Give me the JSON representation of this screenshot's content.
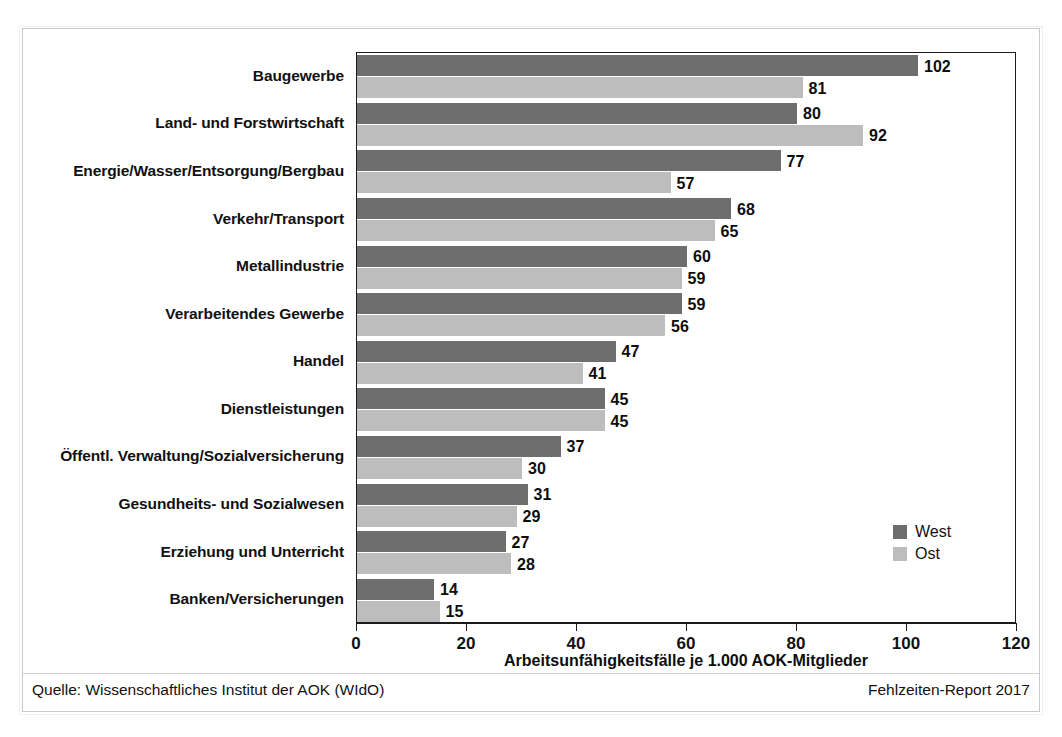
{
  "chart_data": {
    "type": "bar",
    "orientation": "horizontal",
    "title": "",
    "xlabel": "Arbeitsunfähigkeitsfälle je 1.000 AOK-Mitglieder",
    "ylabel": "",
    "xlim": [
      0,
      120
    ],
    "xticks": [
      0,
      20,
      40,
      60,
      80,
      100,
      120
    ],
    "xtick_labels": [
      "0",
      "20",
      "40",
      "60",
      "80",
      "100",
      "120"
    ],
    "grid": false,
    "legend_position": "inside-bottom-right",
    "categories": [
      "Baugewerbe",
      "Land- und Forstwirtschaft",
      "Energie/Wasser/Entsorgung/Bergbau",
      "Verkehr/Transport",
      "Metallindustrie",
      "Verarbeitendes Gewerbe",
      "Handel",
      "Dienstleistungen",
      "Öffentl. Verwaltung/Sozialversicherung",
      "Gesundheits- und Sozialwesen",
      "Erziehung und Unterricht",
      "Banken/Versicherungen"
    ],
    "series": [
      {
        "name": "West",
        "color": "#6e6e6e",
        "values": [
          102,
          80,
          77,
          68,
          60,
          59,
          47,
          45,
          37,
          31,
          27,
          14
        ]
      },
      {
        "name": "Ost",
        "color": "#bdbdbd",
        "values": [
          81,
          92,
          57,
          65,
          59,
          56,
          41,
          45,
          30,
          29,
          28,
          15
        ]
      }
    ]
  },
  "legend": {
    "items": [
      {
        "label": "West",
        "color": "#6e6e6e"
      },
      {
        "label": "Ost",
        "color": "#bdbdbd"
      }
    ]
  },
  "footer": {
    "source": "Quelle: Wissenschaftliches Institut der AOK (WIdO)",
    "report": "Fehlzeiten-Report 2017"
  }
}
